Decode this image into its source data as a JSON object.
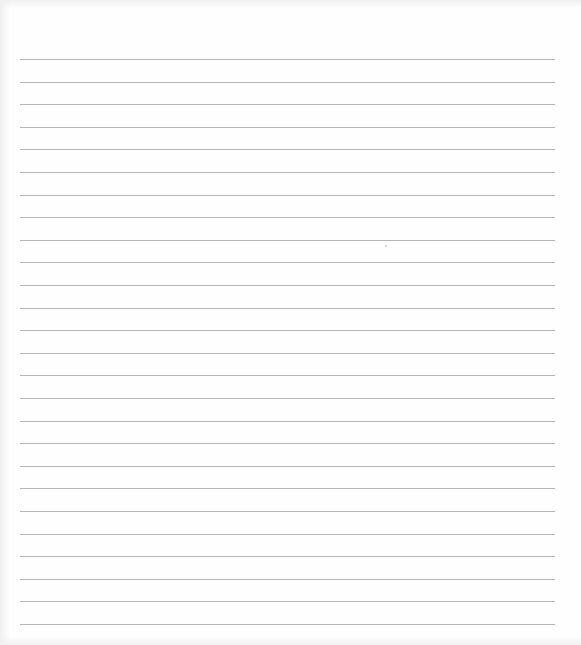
{
  "page": {
    "type": "lined-paper",
    "background_color": "#fefefe",
    "rule_color": "#a9a9a9",
    "rules": {
      "count": 26,
      "first_y": 59,
      "spacing": 22.6,
      "x_start": 20,
      "x_end": 555
    },
    "text": []
  }
}
